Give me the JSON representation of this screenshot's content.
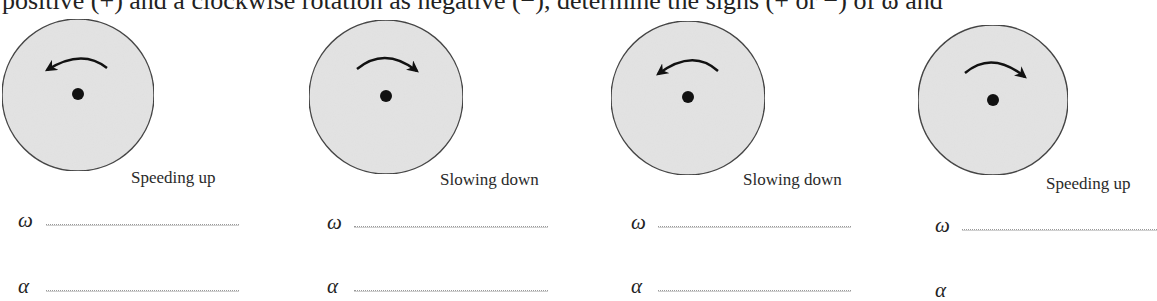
{
  "intro_text": "positive (+) and a clockwise rotation as negative (−), determine the signs (+ or −) of ω and",
  "colors": {
    "disk_fill": "#e3e3e3",
    "disk_stroke": "#3a3a3a",
    "arrow": "#111111",
    "axle": "#111111"
  },
  "disks": [
    {
      "rotation": "counterclockwise",
      "caption": "Speeding up",
      "omega_symbol": "ω",
      "omega_answer": "",
      "alpha_symbol": "α",
      "alpha_answer": ""
    },
    {
      "rotation": "clockwise",
      "caption": "Slowing down",
      "omega_symbol": "ω",
      "omega_answer": "",
      "alpha_symbol": "α",
      "alpha_answer": ""
    },
    {
      "rotation": "counterclockwise",
      "caption": "Slowing down",
      "omega_symbol": "ω",
      "omega_answer": "",
      "alpha_symbol": "α",
      "alpha_answer": ""
    },
    {
      "rotation": "clockwise",
      "caption": "Speeding up",
      "omega_symbol": "ω",
      "omega_answer": "",
      "alpha_symbol": "α",
      "alpha_answer": ""
    }
  ]
}
